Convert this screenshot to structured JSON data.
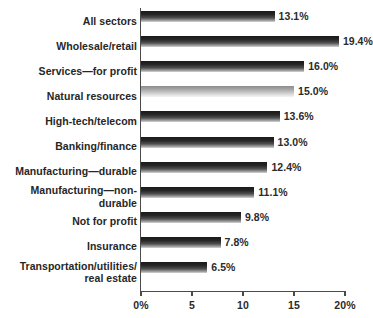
{
  "chart_data": {
    "type": "bar",
    "orientation": "horizontal",
    "title": "",
    "subtitle": "",
    "xlabel": "",
    "ylabel": "",
    "xlim": [
      0,
      20
    ],
    "grid": false,
    "legend": null,
    "value_suffix": "%",
    "axis": {
      "ticks": [
        0,
        5,
        10,
        15,
        20
      ],
      "tick_labels": [
        "0%",
        "5",
        "10",
        "15",
        "20%"
      ]
    },
    "categories": [
      "All sectors",
      "Wholesale/retail",
      "Services—for profit",
      "Natural resources",
      "High-tech/telecom",
      "Banking/finance",
      "Manufacturing—durable",
      "Manufacturing—non-durable",
      "Not for profit",
      "Insurance",
      "Transportation/utilities/\nreal estate"
    ],
    "values": [
      13.1,
      19.4,
      16.0,
      15.0,
      13.6,
      13.0,
      12.4,
      11.1,
      9.8,
      7.8,
      6.5
    ],
    "value_labels": [
      "13.1%",
      "19.4%",
      "16.0%",
      "15.0%",
      "13.6%",
      "13.0%",
      "12.4%",
      "11.1%",
      "9.8%",
      "7.8%",
      "6.5%"
    ],
    "bar_styles": [
      "dark",
      "dark",
      "dark",
      "light",
      "dark",
      "dark",
      "dark",
      "dark",
      "dark",
      "dark",
      "dark"
    ]
  },
  "colors": {
    "background": "#ffffff",
    "axis": "#4a4a4a",
    "text": "#262626",
    "bar_dark_top": "#1a1a1a",
    "bar_dark_bottom": "#d6d6d6",
    "bar_light_top": "#8d8d8d",
    "bar_light_bottom": "#f4f4f4"
  }
}
